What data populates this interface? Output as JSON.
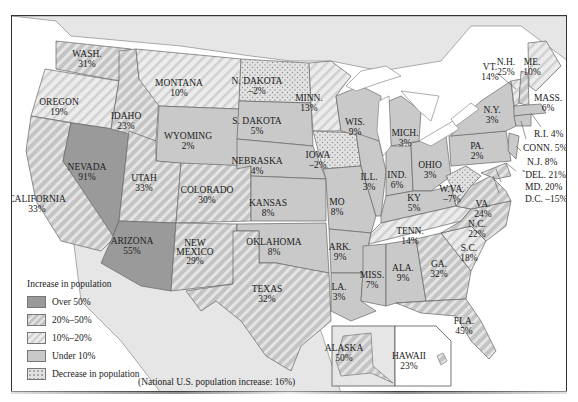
{
  "map": {
    "title": "U.S. Population Change by State",
    "footnote": "(National U.S. population increase: 16%)",
    "colors": {
      "over_50": "#9a9a9a",
      "p20_50": "#c8c8c8",
      "p10_20": "#e0e0e0",
      "under_10": "#c9c9c9",
      "decrease": "#dcdcdc",
      "water": "#ffffff",
      "foreign_land": "#e6e6e6",
      "border": "#666666"
    },
    "legend": {
      "title": "Increase in population",
      "items": [
        {
          "label": "Over 50%",
          "pattern": "solid-dark"
        },
        {
          "label": "20%–50%",
          "pattern": "dense-diagonal"
        },
        {
          "label": "10%–20%",
          "pattern": "light-diagonal"
        },
        {
          "label": "Under 10%",
          "pattern": "solid-light"
        },
        {
          "label": "Decrease in population",
          "pattern": "dots"
        }
      ]
    },
    "states": [
      {
        "name": "WASH.",
        "value": "31%",
        "category": "20-50"
      },
      {
        "name": "OREGON",
        "value": "19%",
        "category": "10-20"
      },
      {
        "name": "CALIFORNIA",
        "value": "33%",
        "category": "20-50"
      },
      {
        "name": "IDAHO",
        "value": "23%",
        "category": "20-50"
      },
      {
        "name": "NEVADA",
        "value": "91%",
        "category": "over-50"
      },
      {
        "name": "MONTANA",
        "value": "10%",
        "category": "10-20"
      },
      {
        "name": "WYOMING",
        "value": "2%",
        "category": "under-10"
      },
      {
        "name": "UTAH",
        "value": "33%",
        "category": "20-50"
      },
      {
        "name": "ARIZONA",
        "value": "55%",
        "category": "over-50"
      },
      {
        "name": "COLORADO",
        "value": "30%",
        "category": "20-50"
      },
      {
        "name": "NEW MEXICO",
        "value": "29%",
        "category": "20-50"
      },
      {
        "name": "N. DAKOTA",
        "value": "–2%",
        "category": "decrease"
      },
      {
        "name": "S. DAKOTA",
        "value": "5%",
        "category": "under-10"
      },
      {
        "name": "NEBRASKA",
        "value": "4%",
        "category": "under-10"
      },
      {
        "name": "KANSAS",
        "value": "8%",
        "category": "under-10"
      },
      {
        "name": "OKLAHOMA",
        "value": "8%",
        "category": "under-10"
      },
      {
        "name": "TEXAS",
        "value": "32%",
        "category": "20-50"
      },
      {
        "name": "MINN.",
        "value": "13%",
        "category": "10-20"
      },
      {
        "name": "IOWA",
        "value": "–2%",
        "category": "decrease"
      },
      {
        "name": "MO",
        "value": "8%",
        "category": "under-10"
      },
      {
        "name": "ARK.",
        "value": "9%",
        "category": "under-10"
      },
      {
        "name": "LA.",
        "value": "3%",
        "category": "under-10"
      },
      {
        "name": "WIS.",
        "value": "9%",
        "category": "under-10"
      },
      {
        "name": "ILL.",
        "value": "3%",
        "category": "under-10"
      },
      {
        "name": "MICH.",
        "value": "3%",
        "category": "under-10"
      },
      {
        "name": "IND.",
        "value": "6%",
        "category": "under-10"
      },
      {
        "name": "OHIO",
        "value": "3%",
        "category": "under-10"
      },
      {
        "name": "KY",
        "value": "5%",
        "category": "under-10"
      },
      {
        "name": "TENN.",
        "value": "14%",
        "category": "10-20"
      },
      {
        "name": "MISS.",
        "value": "7%",
        "category": "under-10"
      },
      {
        "name": "ALA.",
        "value": "9%",
        "category": "under-10"
      },
      {
        "name": "GA.",
        "value": "32%",
        "category": "20-50"
      },
      {
        "name": "FLA.",
        "value": "45%",
        "category": "20-50"
      },
      {
        "name": "S.C.",
        "value": "18%",
        "category": "10-20"
      },
      {
        "name": "N.C.",
        "value": "22%",
        "category": "20-50"
      },
      {
        "name": "VA.",
        "value": "24%",
        "category": "20-50"
      },
      {
        "name": "W.VA.",
        "value": "–7%",
        "category": "decrease"
      },
      {
        "name": "PA.",
        "value": "2%",
        "category": "under-10"
      },
      {
        "name": "N.Y.",
        "value": "3%",
        "category": "under-10"
      },
      {
        "name": "VT.",
        "value": "14%",
        "category": "10-20"
      },
      {
        "name": "N.H.",
        "value": "25%",
        "category": "20-50"
      },
      {
        "name": "ME.",
        "value": "10%",
        "category": "10-20"
      },
      {
        "name": "MASS.",
        "value": "6%",
        "category": "under-10"
      },
      {
        "name": "R.I.",
        "value": "4%",
        "category": "under-10"
      },
      {
        "name": "CONN.",
        "value": "5%",
        "category": "under-10"
      },
      {
        "name": "N.J.",
        "value": "8%",
        "category": "under-10"
      },
      {
        "name": "DEL.",
        "value": "21%",
        "category": "20-50"
      },
      {
        "name": "MD.",
        "value": "20%",
        "category": "20-50"
      },
      {
        "name": "D.C.",
        "value": "–15%",
        "category": "decrease"
      },
      {
        "name": "ALASKA",
        "value": "50%",
        "category": "20-50"
      },
      {
        "name": "HAWAII",
        "value": "23%",
        "category": "20-50"
      }
    ],
    "callouts": {
      "ri": "R.I. 4%",
      "conn": "CONN. 5%",
      "nj": "N.J. 8%",
      "del": "DEL. 21%",
      "md": "MD. 20%",
      "dc": "D.C. –15%"
    }
  }
}
